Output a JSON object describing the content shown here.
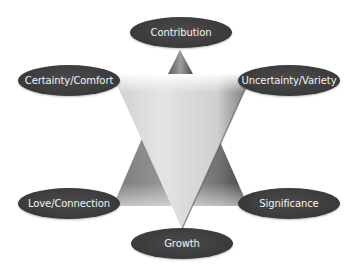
{
  "diagram": {
    "type": "six-human-needs-star",
    "nodes": [
      {
        "id": "contribution",
        "label": "Contribution",
        "x": 181,
        "y": 32
      },
      {
        "id": "certainty",
        "label": "Certainty/Comfort",
        "x": 69,
        "y": 80
      },
      {
        "id": "uncertainty",
        "label": "Uncertainty/Variety",
        "x": 289,
        "y": 80
      },
      {
        "id": "love",
        "label": "Love/Connection",
        "x": 69,
        "y": 203
      },
      {
        "id": "significance",
        "label": "Significance",
        "x": 289,
        "y": 203
      },
      {
        "id": "growth",
        "label": "Growth",
        "x": 182,
        "y": 243
      }
    ],
    "shapes": {
      "upright_triangle": {
        "color_light": "#8a8a8a",
        "color_dark": "#4c4c4c"
      },
      "inverted_triangle": {
        "color_light": "#e6e6e6",
        "color_dark": "#a8a8a8"
      },
      "node_fill": "#3c3c3c",
      "node_text": "#f2f2f2"
    }
  }
}
